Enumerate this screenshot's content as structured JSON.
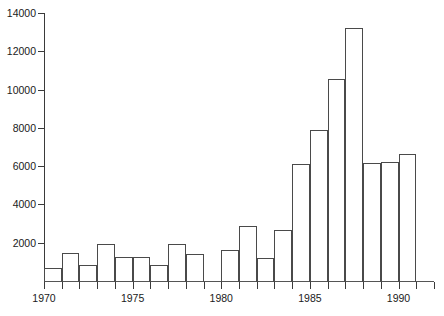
{
  "chart_data": {
    "type": "bar",
    "title": "",
    "subtitle": "",
    "xlabel": "",
    "ylabel": "",
    "categories": [
      1970,
      1971,
      1972,
      1973,
      1974,
      1975,
      1976,
      1977,
      1978,
      1979,
      1980,
      1981,
      1982,
      1983,
      1984,
      1985,
      1986,
      1987,
      1988,
      1989,
      1990,
      1991
    ],
    "values": [
      700,
      1480,
      850,
      1930,
      1250,
      1250,
      820,
      1930,
      1430,
      0,
      1600,
      2860,
      1200,
      2640,
      6120,
      7900,
      10550,
      13200,
      6180,
      6230,
      6650,
      0
    ],
    "series": [
      {
        "name": "count",
        "values": [
          700,
          1480,
          850,
          1930,
          1250,
          1250,
          820,
          1930,
          1430,
          0,
          1600,
          2860,
          1200,
          2640,
          6120,
          7900,
          10550,
          13200,
          6180,
          6230,
          6650,
          0
        ]
      }
    ],
    "ylim": [
      0,
      14000
    ],
    "xlim": [
      1970,
      1992
    ],
    "y_ticks": [
      2000,
      4000,
      6000,
      8000,
      10000,
      12000,
      14000
    ],
    "y_tick_labels": [
      "2000",
      "4000",
      "6000",
      "8000",
      "10000",
      "12000",
      "14000"
    ],
    "x_ticks": [
      1970,
      1971,
      1972,
      1973,
      1974,
      1975,
      1976,
      1977,
      1978,
      1979,
      1980,
      1981,
      1982,
      1983,
      1984,
      1985,
      1986,
      1987,
      1988,
      1989,
      1990,
      1991,
      1992
    ],
    "x_tick_labels_shown": [
      {
        "value": 1970,
        "label": "1970"
      },
      {
        "value": 1975,
        "label": "1975"
      },
      {
        "value": 1980,
        "label": "1980"
      },
      {
        "value": 1985,
        "label": "1985"
      },
      {
        "value": 1990,
        "label": "1990"
      }
    ],
    "grid": false,
    "legend": null,
    "bar_style": {
      "fill": "none",
      "edge_color": "#4a4a4a",
      "bar_width_years": 1
    },
    "colors": {
      "background": "#ffffff",
      "axis": "#3a3a3a",
      "text": "#1a1a1a",
      "bar_edge": "#4a4a4a"
    },
    "annotations": []
  }
}
